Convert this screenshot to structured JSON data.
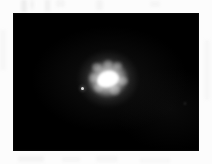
{
  "image": {
    "kind": "astronomical-photograph",
    "subject_label": "bright-unresolved-source",
    "description": "Monochrome astronomical exposure: one saturated bright object with diffuse halo, one faint companion point, on a black sky field within a white scan margin.",
    "caption": "",
    "background_color": "#000000",
    "margin_color": "#fcfcfc",
    "source_color": "#ffffff"
  },
  "frame": {
    "left": 13,
    "top": 13,
    "width": 186,
    "height": 138
  },
  "objects": [
    {
      "name": "primary-source",
      "x": 108,
      "y": 79,
      "core_width": 22,
      "core_height": 16,
      "halo_diameter": 60,
      "brightness": "saturated",
      "color": "#ffffff"
    },
    {
      "name": "companion-point",
      "x": 82,
      "y": 88,
      "core_width": 3,
      "core_height": 3,
      "brightness": "faint",
      "color": "#ffffff"
    },
    {
      "name": "background-speck",
      "x": 185,
      "y": 103,
      "core_width": 2,
      "core_height": 3,
      "brightness": "very-faint",
      "color": "#ffffff"
    }
  ],
  "margin_artifacts": {
    "label": "scanner-smudges",
    "color": "#ececec"
  }
}
